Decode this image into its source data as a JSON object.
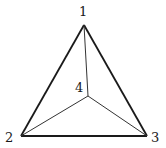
{
  "diagram": {
    "type": "tetrahedron-projection",
    "vertices": [
      {
        "id": "1",
        "label": "1",
        "x": 84,
        "y": 25
      },
      {
        "id": "2",
        "label": "2",
        "x": 21,
        "y": 136
      },
      {
        "id": "3",
        "label": "3",
        "x": 147,
        "y": 136
      },
      {
        "id": "4",
        "label": "4",
        "x": 88,
        "y": 96
      }
    ],
    "outer_edges": [
      [
        "1",
        "2"
      ],
      [
        "2",
        "3"
      ],
      [
        "3",
        "1"
      ]
    ],
    "inner_edges": [
      [
        "4",
        "1"
      ],
      [
        "4",
        "2"
      ],
      [
        "4",
        "3"
      ]
    ],
    "colors": {
      "outer_edge": "#1a1a1a",
      "inner_edge": "#333333",
      "background": "#ffffff"
    }
  }
}
